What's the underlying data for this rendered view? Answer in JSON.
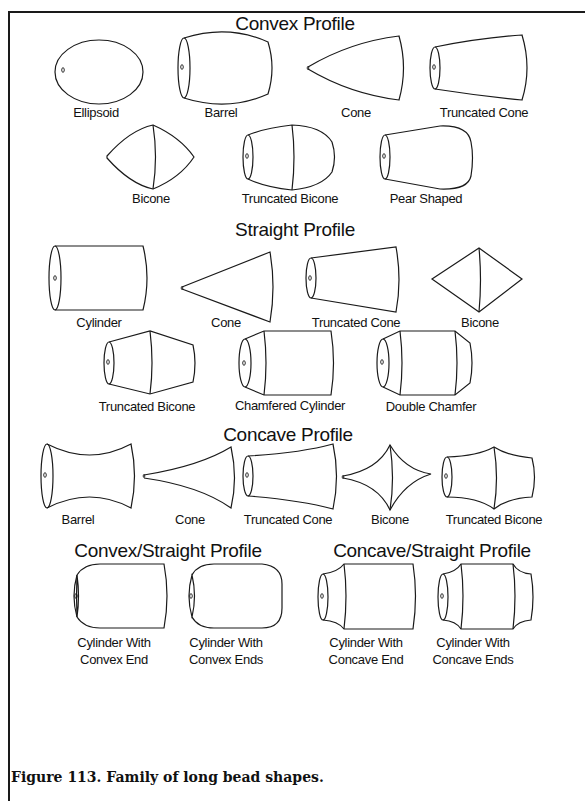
{
  "sections": {
    "convex": {
      "title": "Convex Profile",
      "items": [
        "Ellipsoid",
        "Barrel",
        "Cone",
        "Truncated Cone",
        "Bicone",
        "Truncated Bicone",
        "Pear Shaped"
      ]
    },
    "straight": {
      "title": "Straight Profile",
      "items": [
        "Cylinder",
        "Cone",
        "Truncated Cone",
        "Bicone",
        "Truncated Bicone",
        "Chamfered Cylinder",
        "Double Chamfer"
      ]
    },
    "concave": {
      "title": "Concave Profile",
      "items": [
        "Barrel",
        "Cone",
        "Truncated Cone",
        "Bicone",
        "Truncated Bicone"
      ]
    },
    "convex_straight": {
      "title": "Convex/Straight Profile",
      "items": [
        {
          "line1": "Cylinder With",
          "line2": "Convex End"
        },
        {
          "line1": "Cylinder With",
          "line2": "Convex Ends"
        }
      ]
    },
    "concave_straight": {
      "title": "Concave/Straight Profile",
      "items": [
        {
          "line1": "Cylinder With",
          "line2": "Concave End"
        },
        {
          "line1": "Cylinder With",
          "line2": "Concave Ends"
        }
      ]
    }
  },
  "caption": "Figure 113.  Family of long bead shapes."
}
